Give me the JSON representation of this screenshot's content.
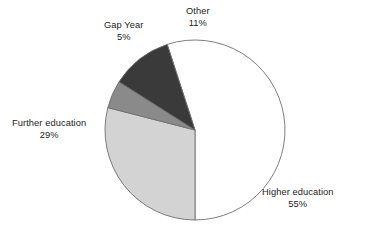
{
  "chart_data": {
    "type": "pie",
    "title": "",
    "subtitle": "",
    "xlabel": "",
    "ylabel": "",
    "legend_position": "none",
    "grid": false,
    "value_suffix": "%",
    "categories": [
      "Higher education",
      "Further education",
      "Gap Year",
      "Other"
    ],
    "values": [
      55,
      29,
      5,
      11
    ],
    "slices": [
      {
        "label": "Higher education",
        "value": 55,
        "value_text": "55%",
        "color": "#ffffff",
        "stroke": "#6f6f6f"
      },
      {
        "label": "Further education",
        "value": 29,
        "value_text": "29%",
        "color": "#d3d3d3",
        "stroke": "#6f6f6f"
      },
      {
        "label": "Gap Year",
        "value": 5,
        "value_text": "5%",
        "color": "#8a8a8a",
        "stroke": "#6f6f6f"
      },
      {
        "label": "Other",
        "value": 11,
        "value_text": "11%",
        "color": "#3a3a3a",
        "stroke": "#6f6f6f"
      }
    ],
    "geometry": {
      "center_x": 195,
      "center_y": 130,
      "radius": 90,
      "start_angle_deg": -18,
      "direction": "clockwise"
    },
    "background_color": "#ffffff",
    "text_color": "#1c1c1c"
  }
}
